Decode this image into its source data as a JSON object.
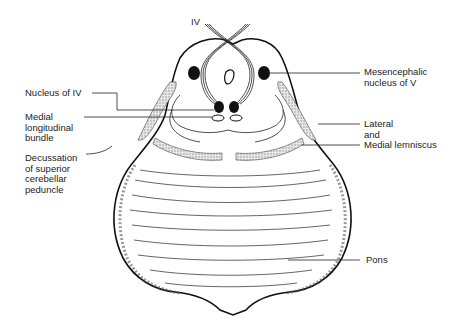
{
  "diagram": {
    "type": "anatomical cross-section (upper pons / midbrain junction)",
    "labels": {
      "iv": "IV",
      "nucleus_iv": "Nucleus of IV",
      "mlf": "Medial\nlongitudinal\nbundle",
      "decussation": "Decussation\nof superior\ncerebellar\npeduncle",
      "mesencephalic": "Mesencephalic\nnucleus of V",
      "lemniscus": "Lateral\nand\nMedial lemniscus",
      "pons": "Pons"
    },
    "colors": {
      "ink": "#111111",
      "stipple": "#bfbfbf",
      "background": "#ffffff"
    }
  }
}
